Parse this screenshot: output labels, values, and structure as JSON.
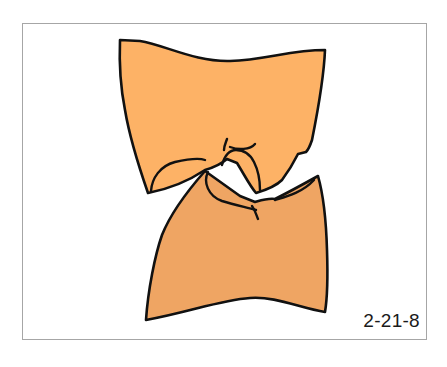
{
  "figure": {
    "label": "2-21-8",
    "frame_border_color": "#a6a6a6",
    "background_color": "#ffffff"
  },
  "teeth": {
    "upper": {
      "name": "upper-tooth",
      "fill_color": "#fdb266",
      "outline_color": "#111111"
    },
    "lower": {
      "name": "lower-tooth",
      "fill_color": "#efa563",
      "outline_color": "#111111"
    }
  }
}
